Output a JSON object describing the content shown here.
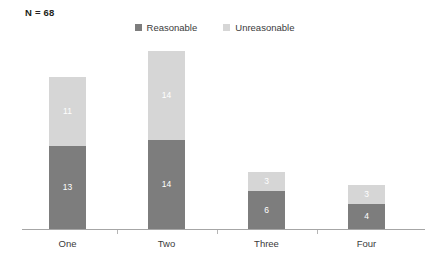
{
  "annotation": {
    "n_label": "N = 68"
  },
  "legend": {
    "position": "top-center",
    "items": [
      {
        "label": "Reasonable",
        "color": "#7d7d7d",
        "icon": "square-swatch-icon"
      },
      {
        "label": "Unreasonable",
        "color": "#d6d6d6",
        "icon": "square-swatch-icon"
      }
    ]
  },
  "axis": {
    "baseline_color": "#a6a6a6",
    "tick_color": "#b5b5b5",
    "tick_count": 3
  },
  "chart_data": {
    "type": "bar",
    "subtype": "stacked-vertical",
    "title": "",
    "subtitle": "",
    "xlabel": "",
    "ylabel": "",
    "grid": false,
    "legend_position": "top-center",
    "categories": [
      "One",
      "Two",
      "Three",
      "Four"
    ],
    "series": [
      {
        "name": "Reasonable",
        "color": "#7d7d7d",
        "values": [
          13,
          14,
          6,
          4
        ]
      },
      {
        "name": "Unreasonable",
        "color": "#d6d6d6",
        "values": [
          11,
          14,
          3,
          3
        ]
      }
    ],
    "stack_totals": [
      24,
      28,
      9,
      7
    ],
    "data_labels": {
      "Reasonable": [
        "13",
        "14",
        "6",
        "4"
      ],
      "Unreasonable": [
        "11",
        "14",
        "3",
        "3"
      ]
    },
    "ylim": [
      0,
      28
    ],
    "annotations": [
      "N = 68"
    ]
  }
}
